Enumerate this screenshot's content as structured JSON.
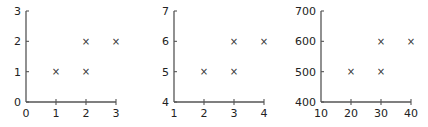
{
  "chart_data": [
    {
      "type": "scatter",
      "title": "",
      "xlabel": "",
      "ylabel": "",
      "xlim": [
        0,
        3
      ],
      "ylim": [
        0,
        3
      ],
      "xticks": [
        "0",
        "1",
        "2",
        "3"
      ],
      "yticks": [
        "0",
        "1",
        "2",
        "3"
      ],
      "marker": "x",
      "points": [
        [
          1,
          1
        ],
        [
          2,
          1
        ],
        [
          2,
          2
        ],
        [
          3,
          2
        ]
      ],
      "x": [
        1,
        2,
        2,
        3
      ],
      "y": [
        1,
        1,
        2,
        2
      ],
      "grid": false
    },
    {
      "type": "scatter",
      "title": "",
      "xlabel": "",
      "ylabel": "",
      "xlim": [
        1,
        4
      ],
      "ylim": [
        4,
        7
      ],
      "xticks": [
        "1",
        "2",
        "3",
        "4"
      ],
      "yticks": [
        "4",
        "5",
        "6",
        "7"
      ],
      "marker": "x",
      "points": [
        [
          2,
          5
        ],
        [
          3,
          5
        ],
        [
          3,
          6
        ],
        [
          4,
          6
        ]
      ],
      "x": [
        2,
        3,
        3,
        4
      ],
      "y": [
        5,
        5,
        6,
        6
      ],
      "grid": false
    },
    {
      "type": "scatter",
      "title": "",
      "xlabel": "",
      "ylabel": "",
      "xlim": [
        10,
        40
      ],
      "ylim": [
        400,
        700
      ],
      "xticks": [
        "10",
        "20",
        "30",
        "40"
      ],
      "yticks": [
        "400",
        "500",
        "600",
        "700"
      ],
      "marker": "x",
      "points": [
        [
          20,
          500
        ],
        [
          30,
          500
        ],
        [
          30,
          600
        ],
        [
          40,
          600
        ]
      ],
      "x": [
        20,
        30,
        30,
        40
      ],
      "y": [
        500,
        500,
        600,
        600
      ],
      "grid": false
    }
  ],
  "panels": [
    {
      "ox": 26,
      "xstep": 30,
      "yticks": [
        "0",
        "1",
        "2",
        "3"
      ],
      "xticks": [
        "0",
        "1",
        "2",
        "3"
      ]
    },
    {
      "ox": 174,
      "xstep": 30,
      "yticks": [
        "4",
        "5",
        "6",
        "7"
      ],
      "xticks": [
        "1",
        "2",
        "3",
        "4"
      ]
    },
    {
      "ox": 321,
      "xstep": 30,
      "yticks": [
        "400",
        "500",
        "600",
        "700"
      ],
      "xticks": [
        "10",
        "20",
        "30",
        "40"
      ]
    }
  ],
  "marker_glyph": "×"
}
